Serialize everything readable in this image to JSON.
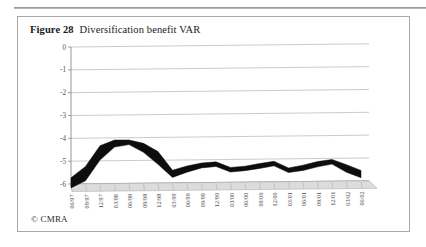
{
  "figure": {
    "label": "Figure 28",
    "title": "Diversification benefit VAR",
    "credit": "© CMRA"
  },
  "colors": {
    "series_line": "#0d0d0d",
    "gridline": "#b6b6b6",
    "axis": "#8a8a8a",
    "frame_border": "#a9a9a9",
    "floor_fill": "#dcdcdc",
    "background": "#ffffff",
    "caption_text": "#1a1a1a"
  },
  "chart_data": {
    "type": "line",
    "title": "Diversification benefit VAR",
    "subtitle": "",
    "xlabel": "",
    "ylabel": "",
    "ylim": [
      -6,
      0
    ],
    "ytick_labels": [
      "0",
      "-1",
      "-2",
      "-3",
      "-4",
      "-5",
      "-6"
    ],
    "ytick_values": [
      0,
      -1,
      -2,
      -3,
      -4,
      -5,
      -6
    ],
    "grid": true,
    "legend": false,
    "legend_position": "none",
    "style_3d": true,
    "annotations": [],
    "categories": [
      "06/97",
      "09/97",
      "12/97",
      "03/98",
      "06/98",
      "09/98",
      "12/98",
      "03/99",
      "06/99",
      "09/99",
      "12/99",
      "03/00",
      "06/00",
      "09/00",
      "12/00",
      "03/01",
      "06/01",
      "09/01",
      "12/01",
      "03/02",
      "06/02"
    ],
    "series": [
      {
        "name": "Diversification benefit VAR",
        "values": [
          -5.95,
          -5.55,
          -4.65,
          -4.25,
          -4.2,
          -4.45,
          -4.9,
          -5.6,
          -5.4,
          -5.25,
          -5.2,
          -5.45,
          -5.4,
          -5.3,
          -5.2,
          -5.5,
          -5.4,
          -5.25,
          -5.15,
          -5.45,
          -5.7
        ]
      }
    ]
  }
}
